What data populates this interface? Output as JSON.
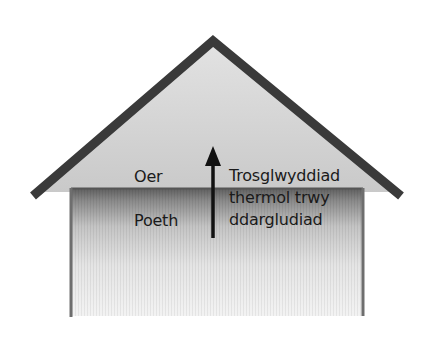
{
  "diagram": {
    "title": "",
    "labels": {
      "cold": "Oer",
      "hot": "Poeth",
      "description_lines": [
        "Trosglwyddiad",
        "thermol trwy",
        "ddargludiad"
      ]
    },
    "arrow": {
      "direction": "up",
      "meaning": "heat transfer from hot to cold"
    },
    "colors": {
      "roof_stroke": "#3a3a3a",
      "attic_fill": "#d6d6d6",
      "wall_stroke": "#6e6e6e",
      "wall_top": "#6a6a6a",
      "wall_bottom": "#f4f4f4",
      "arrow": "#111111",
      "text": "#1a1a1a"
    }
  }
}
